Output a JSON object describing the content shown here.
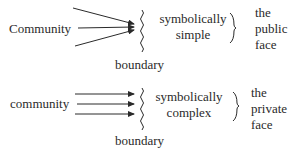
{
  "diagrams": [
    {
      "source_label": "Community",
      "boundary_label": "boundary",
      "symbolic_line1": "symbolically",
      "symbolic_line2": "simple",
      "face_line1": "the",
      "face_line2": "public",
      "face_line3": "face",
      "arrows": "converging"
    },
    {
      "source_label": "community",
      "boundary_label": "boundary",
      "symbolic_line1": "symbolically",
      "symbolic_line2": "complex",
      "face_line1": "the",
      "face_line2": "private",
      "face_line3": "face",
      "arrows": "parallel"
    }
  ]
}
